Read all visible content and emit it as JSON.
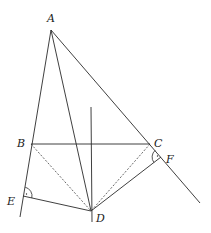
{
  "diagram": {
    "type": "geometry",
    "points": {
      "A": {
        "label": "A",
        "x": 51,
        "y": 30,
        "lx": 47,
        "ly": 22
      },
      "B": {
        "label": "B",
        "x": 31,
        "y": 144,
        "lx": 17,
        "ly": 147
      },
      "C": {
        "label": "C",
        "x": 150,
        "y": 144,
        "lx": 154,
        "ly": 147
      },
      "D": {
        "label": "D",
        "x": 91,
        "y": 211,
        "lx": 96,
        "ly": 222
      },
      "E": {
        "label": "E",
        "x": 23,
        "y": 196,
        "lx": 7,
        "ly": 205
      },
      "F": {
        "label": "F",
        "x": 161,
        "y": 157,
        "lx": 166,
        "ly": 163
      }
    },
    "segments": [
      {
        "name": "line-A-B-E",
        "from": "A",
        "x1": 51,
        "y1": 30,
        "x2": 20,
        "y2": 217,
        "style": "solid"
      },
      {
        "name": "line-A-C-F",
        "from": "A",
        "x1": 51,
        "y1": 30,
        "x2": 200,
        "y2": 203,
        "style": "solid"
      },
      {
        "name": "segment-A-D",
        "x1": 51,
        "y1": 30,
        "x2": 91,
        "y2": 211,
        "style": "solid"
      },
      {
        "name": "segment-B-C",
        "x1": 31,
        "y1": 144,
        "x2": 150,
        "y2": 144,
        "style": "solid"
      },
      {
        "name": "perpendicular-bisector-BC",
        "x1": 91,
        "y1": 107,
        "x2": 92,
        "y2": 222,
        "style": "solid"
      },
      {
        "name": "segment-B-D",
        "x1": 31,
        "y1": 144,
        "x2": 91,
        "y2": 211,
        "style": "dashed"
      },
      {
        "name": "segment-C-D",
        "x1": 150,
        "y1": 144,
        "x2": 91,
        "y2": 211,
        "style": "dashed"
      },
      {
        "name": "segment-E-D",
        "x1": 23,
        "y1": 196,
        "x2": 91,
        "y2": 211,
        "style": "solid"
      },
      {
        "name": "segment-F-D",
        "x1": 161,
        "y1": 157,
        "x2": 91,
        "y2": 211,
        "style": "solid"
      }
    ],
    "right_angles": [
      {
        "at": "E",
        "path": "M 25.2 187.2 A 9 9 0 0 1 31.8 198.0",
        "dot": {
          "x": 26.5,
          "y": 194
        }
      },
      {
        "at": "F",
        "path": "M 153.9 162.5 A 9 9 0 0 1 155.2 150.3",
        "dot": {
          "x": 157.5,
          "y": 156
        }
      }
    ],
    "colors": {
      "stroke": "#2a2a2a",
      "background": "#ffffff"
    }
  }
}
